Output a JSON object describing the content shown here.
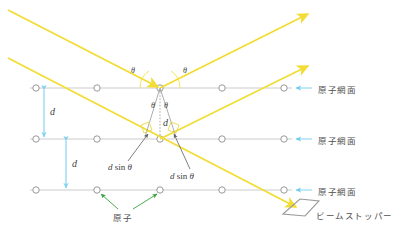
{
  "figure": {
    "kind": "bragg-diffraction-diagram",
    "canvas": {
      "width": 404,
      "height": 234,
      "background": "#ffffff"
    },
    "colors": {
      "beam": "#f2dd35",
      "lattice_line": "#c6c6c6",
      "atom_outline": "#8d8d8d",
      "spacing_arrow": "#6ecbf0",
      "callout_arrow": "#5f5f5f",
      "atom_pointer": "#36a13a",
      "beam_stopper": "#9a9a9a",
      "text": "#4a4a4a"
    },
    "rows": [
      {
        "y": 88,
        "label": "原子網面"
      },
      {
        "y": 139,
        "label": "原子網面"
      },
      {
        "y": 190,
        "label": "原子網面"
      }
    ],
    "atom_x": [
      36,
      97,
      160,
      222,
      284
    ],
    "plane_labels": [
      {
        "text": "原子網面",
        "x": 318,
        "y": 88
      },
      {
        "text": "原子網面",
        "x": 318,
        "y": 139
      },
      {
        "text": "原子網面",
        "x": 318,
        "y": 190
      }
    ],
    "spacing_labels": [
      {
        "text": "d",
        "x": 50,
        "y": 107
      },
      {
        "text": "d",
        "x": 72,
        "y": 160
      },
      {
        "text": "d",
        "x": 163,
        "y": 120
      }
    ],
    "angle_labels": [
      {
        "text": "θ",
        "x": 131,
        "y": 69
      },
      {
        "text": "θ",
        "x": 183,
        "y": 69
      },
      {
        "text": "θ",
        "x": 152,
        "y": 104
      },
      {
        "text": "θ",
        "x": 164,
        "y": 104
      }
    ],
    "path_diff_labels": [
      {
        "text_italic": "d",
        "text_upright": " sin ",
        "text_theta": "θ",
        "x": 110,
        "y": 166
      },
      {
        "text_italic": "d",
        "text_upright": " sin ",
        "text_theta": "θ",
        "x": 170,
        "y": 175
      }
    ],
    "atom_callout": {
      "text": "原子",
      "x": 113,
      "y": 216
    },
    "beam_stopper": {
      "text": "ビームストッパー",
      "x": 316,
      "y": 214
    },
    "legend_terms": {
      "plane": "原子網面",
      "atom": "原子",
      "stopper": "ビームストッパー",
      "spacing_symbol": "d",
      "angle_symbol": "θ",
      "path_difference": "d sin θ"
    }
  }
}
